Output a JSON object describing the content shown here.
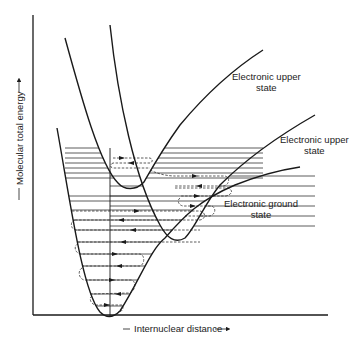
{
  "figure": {
    "type": "potential-energy-curves",
    "y_axis_label": "Molecular total energy",
    "x_axis_label": "Internuclear distance",
    "y_axis_arrow": "arrow-up",
    "x_axis_arrow": "arrow-right",
    "curves": [
      {
        "id": "upper-1",
        "label_line1": "Electronic upper",
        "label_line2": "state"
      },
      {
        "id": "upper-2",
        "label_line1": "Electronic upper",
        "label_line2": "state"
      },
      {
        "id": "ground",
        "label_line1": "Electronic ground",
        "label_line2": "state"
      }
    ],
    "annotations": {
      "vibrational_levels": "horizontal solid lines within each potential well",
      "transitions": "dashed arrows indicating vibrational relaxation paths",
      "vertical_excitation": "vertical line from ground state minimum upward"
    }
  }
}
